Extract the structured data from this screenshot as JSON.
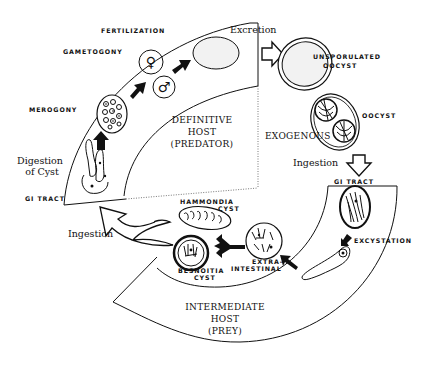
{
  "diagram": {
    "regions": {
      "definitive_host": {
        "line1": "DEFINITIVE",
        "line2": "HOST",
        "line3": "(PREDATOR)"
      },
      "exogenous": "EXOGENOUS",
      "intermediate_host": {
        "line1": "INTERMEDIATE",
        "line2": "HOST",
        "line3": "(PREY)"
      }
    },
    "stage_labels": {
      "fertilization": "FERTILIZATION",
      "gametogony": "GAMETOGONY",
      "merogony": "MEROGONY",
      "gi_tract_left": "GI TRACT",
      "unsporulated_oocyst_line1": "UNSPORULATED",
      "unsporulated_oocyst_line2": "OOCYST",
      "oocyst": "OOCYST",
      "gi_tract_right": "GI TRACT",
      "excystation": "EXCYSTATION",
      "hammondia_cyst_line1": "HAMMONDIA",
      "hammondia_cyst_line2": "CYST",
      "besnoitia_cyst_line1": "BESNOITIA",
      "besnoitia_cyst_line2": "CYST",
      "extra_intestinal_line1": "EXTRA-",
      "extra_intestinal_line2": "INTESTINAL"
    },
    "process_labels": {
      "excretion": "Excretion",
      "ingestion_right": "Ingestion",
      "ingestion_left": "Ingestion",
      "digestion_line1": "Digestion",
      "digestion_line2": "of Cyst"
    },
    "symbols": {
      "female": "♀",
      "male": "♂"
    },
    "colors": {
      "ink": "#111111",
      "cell_fill": "#f2f2f2",
      "background": "#ffffff"
    }
  }
}
